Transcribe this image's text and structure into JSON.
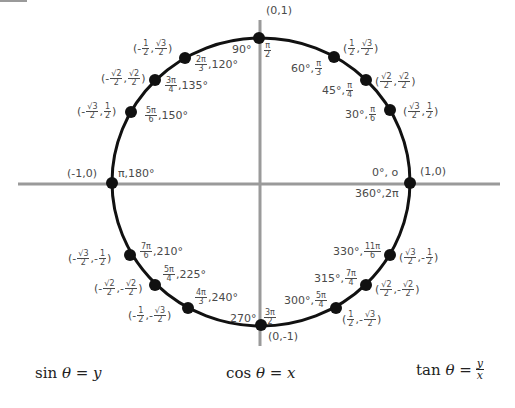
{
  "diagram": {
    "center": [
      261,
      182
    ],
    "radius_x": 149,
    "radius_y": 144,
    "axis_color": "#9a9a9a",
    "circle_color": "#111111",
    "point_color": "#111111",
    "axes": {
      "x_range": [
        18,
        500
      ],
      "y_range": [
        20,
        346
      ],
      "y_at": 184
    },
    "points": [
      {
        "angle_deg": 0,
        "coord": "(1,0)",
        "angle_label": "0°, 0 / 360°, 2π"
      },
      {
        "angle_deg": 30,
        "coord": "(√3/2, 1/2)",
        "angle_label": "30°, π/6"
      },
      {
        "angle_deg": 45,
        "coord": "(√2/2, √2/2)",
        "angle_label": "45°, π/4"
      },
      {
        "angle_deg": 60,
        "coord": "(1/2, √3/2)",
        "angle_label": "60°, π/3"
      },
      {
        "angle_deg": 90,
        "coord": "(0,1)",
        "angle_label": "90°, π/2"
      },
      {
        "angle_deg": 120,
        "coord": "(-1/2, √3/2)",
        "angle_label": "2π/3, 120°"
      },
      {
        "angle_deg": 135,
        "coord": "(-√2/2, √2/2)",
        "angle_label": "3π/4, 135°"
      },
      {
        "angle_deg": 150,
        "coord": "(-√3/2, 1/2)",
        "angle_label": "5π/6, 150°"
      },
      {
        "angle_deg": 180,
        "coord": "(-1,0)",
        "angle_label": "π, 180°"
      },
      {
        "angle_deg": 210,
        "coord": "(-√3/2, -1/2)",
        "angle_label": "7π/6, 210°"
      },
      {
        "angle_deg": 225,
        "coord": "(-√2/2, -√2/2)",
        "angle_label": "5π/4, 225°"
      },
      {
        "angle_deg": 240,
        "coord": "(-1/2, -√3/2)",
        "angle_label": "4π/3, 240°"
      },
      {
        "angle_deg": 270,
        "coord": "(0,-1)",
        "angle_label": "270°, 3π/2"
      },
      {
        "angle_deg": 300,
        "coord": "(1/2, -√3/2)",
        "angle_label": "300°, 5π/4"
      },
      {
        "angle_deg": 315,
        "coord": "(√2/2, -√2/2)",
        "angle_label": "315°, 7π/4"
      },
      {
        "angle_deg": 330,
        "coord": "(√3/2, -1/2)",
        "angle_label": "330°, 11π/6"
      }
    ],
    "text": {
      "p0_deg": "0°, o",
      "p0_full": "360°,2π",
      "p0_coord": "(1,0)",
      "p90_deg": "90°",
      "p90_num": "π",
      "p90_den": "2",
      "p90_coord": "(0,1)",
      "p180_coord": "(-1,0)",
      "p180_angle": "π,180°",
      "p270_deg": "270°",
      "p270_num": "3π",
      "p270_den": "2",
      "p270_coord": "(0,-1)",
      "sq3": "√3",
      "sq2": "√2",
      "one": "1",
      "two": "2",
      "minus": "-",
      "p30_deg": "30°,",
      "p30_num": "π",
      "p30_den": "6",
      "p45_deg": "45°,",
      "p45_num": "π",
      "p45_den": "4",
      "p60_deg": "60°,",
      "p60_num": "π",
      "p60_den": "3",
      "p120_num": "2π",
      "p120_den": "3",
      "p120_deg": ",120°",
      "p135_num": "3π",
      "p135_den": "4",
      "p135_deg": ",135°",
      "p150_num": "5π",
      "p150_den": "6",
      "p150_deg": ",150°",
      "p210_num": "7π",
      "p210_den": "6",
      "p210_deg": ",210°",
      "p225_num": "5π",
      "p225_den": "4",
      "p225_deg": ",225°",
      "p240_num": "4π",
      "p240_den": "3",
      "p240_deg": ",240°",
      "p300_deg": "300°,",
      "p300_num": "5π",
      "p300_den": "4",
      "p315_deg": "315°,",
      "p315_num": "7π",
      "p315_den": "4",
      "p330_deg": "330°,",
      "p330_num": "11π",
      "p330_den": "6"
    }
  },
  "formulas": {
    "sin": {
      "fn": "sin",
      "theta": "θ",
      "eq": "=",
      "rhs": "y"
    },
    "cos": {
      "fn": "cos",
      "theta": "θ",
      "eq": "=",
      "rhs": "x"
    },
    "tan": {
      "fn": "tan",
      "theta": "θ",
      "eq": "=",
      "num": "y",
      "den": "x"
    }
  }
}
